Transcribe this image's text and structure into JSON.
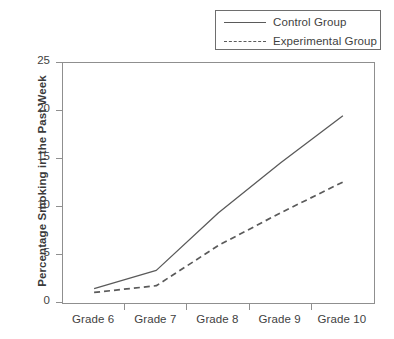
{
  "chart_data": {
    "type": "line",
    "title": "",
    "xlabel": "",
    "ylabel": "Percentage Smoking in the Past Week",
    "categories": [
      "Grade 6",
      "Grade 7",
      "Grade 8",
      "Grade 9",
      "Grade 10"
    ],
    "ylim": [
      0,
      25
    ],
    "yticks": [
      0,
      5,
      10,
      15,
      20,
      25
    ],
    "ytick_labels": [
      "0",
      "5",
      "10",
      "15",
      "20",
      "25"
    ],
    "grid": false,
    "legend_position": "top-right",
    "series": [
      {
        "name": "Control Group",
        "style": "solid",
        "color": "#5a5a5a",
        "values": [
          1.5,
          3.4,
          9.4,
          14.6,
          19.5
        ]
      },
      {
        "name": "Experimental Group",
        "style": "dashed",
        "color": "#5a5a5a",
        "values": [
          1.1,
          1.8,
          6.0,
          9.4,
          12.6
        ]
      }
    ]
  },
  "legend": {
    "entries": [
      {
        "label": "Control Group",
        "swatch": "solid-line-swatch"
      },
      {
        "label": "Experimental Group",
        "swatch": "dashed-line-swatch"
      }
    ]
  },
  "axes": {
    "y_title": "Percentage Smoking in the Past Week",
    "y_tick_labels": [
      "25",
      "20",
      "15",
      "10",
      "5",
      "0"
    ],
    "x_tick_labels": [
      "Grade 6",
      "Grade 7",
      "Grade 8",
      "Grade 9",
      "Grade 10"
    ]
  }
}
